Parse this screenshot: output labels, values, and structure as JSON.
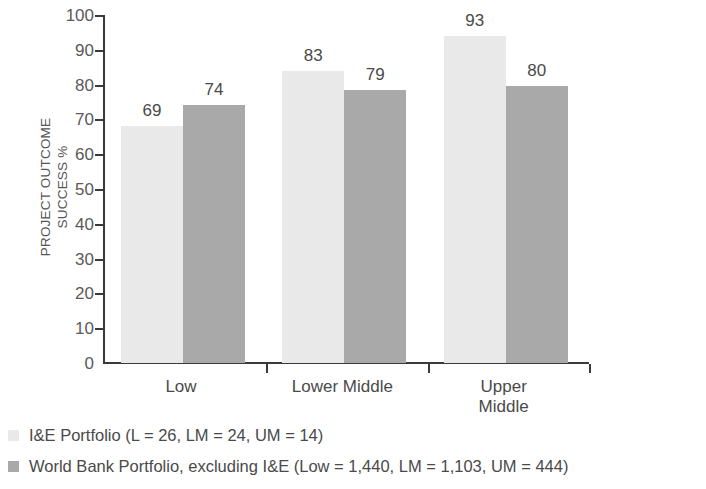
{
  "chart_data": {
    "type": "bar",
    "title": "",
    "xlabel": "",
    "ylabel": "PROJECT OUTCOME\nSUCCESS %",
    "categories": [
      "Low",
      "Lower Middle",
      "Upper Middle"
    ],
    "series": [
      {
        "name": "I&E Portfolio (L = 26, LM = 24, UM = 14)",
        "color": "#e9e9e9",
        "values": [
          69,
          83,
          93
        ],
        "bar_tops": [
          68,
          84,
          94
        ]
      },
      {
        "name": "World Bank Portfolio, excluding I&E (Low = 1,440, LM = 1,103, UM = 444)",
        "color": "#a9a9a9",
        "values": [
          74,
          79,
          80
        ],
        "bar_tops": [
          74,
          78.5,
          79.5
        ]
      }
    ],
    "ylim": [
      0,
      100
    ],
    "yticks": [
      0,
      10,
      20,
      30,
      40,
      50,
      60,
      70,
      80,
      90,
      100
    ],
    "ytick_labels": [
      "0",
      "10",
      "20",
      "30",
      "40",
      "50",
      "60",
      "70",
      "80",
      "90",
      "100"
    ],
    "grid": false,
    "legend_position": "bottom-left",
    "axis_color": "#3a3a3a",
    "background": "#ffffff"
  },
  "legend": {
    "items": [
      {
        "label": "I&E Portfolio (L = 26, LM = 24, UM = 14)",
        "color": "#e9e9e9"
      },
      {
        "label": "World Bank Portfolio, excluding I&E (Low = 1,440, LM = 1,103, UM = 444)",
        "color": "#a9a9a9"
      }
    ]
  }
}
